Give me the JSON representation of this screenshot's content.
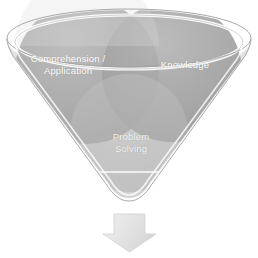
{
  "diagram": {
    "type": "venn-in-funnel",
    "title": "",
    "background_color": "#ffffff",
    "funnel": {
      "name": "funnel-cone",
      "outline_color": "#9a9a9a",
      "rim_color": "#ffffff",
      "fill_color": "#d8d8d8",
      "inner_line_color": "#ffffff"
    },
    "circles": [
      {
        "id": "comprehension",
        "label": "Comprehension /\nApplication",
        "fill_color": "#a8a8a8",
        "position": "upper-left"
      },
      {
        "id": "knowledge",
        "label": "Knowledge",
        "fill_color": "#a0a0a0",
        "position": "upper-right"
      },
      {
        "id": "problem-solving",
        "label": "Problem\nSolving",
        "fill_color": "#c9c9c9",
        "position": "bottom-center"
      }
    ],
    "arrow": {
      "name": "down-arrow",
      "direction": "down",
      "fill_color": "#e3e3e3",
      "edge_color": "#cfcfcf"
    }
  }
}
